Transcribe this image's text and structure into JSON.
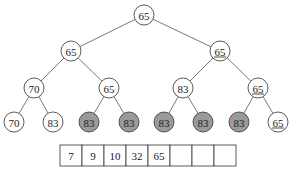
{
  "colors": {
    "shaded_fill": "#9a9a9a",
    "plain_fill": "#ffffff",
    "stroke": "#333333"
  },
  "tree": {
    "nodes": [
      {
        "id": "n0",
        "label": "65",
        "x": 144,
        "y": 15,
        "shaded": false,
        "underlined": false
      },
      {
        "id": "n1",
        "label": "65",
        "x": 71,
        "y": 51,
        "shaded": false,
        "underlined": false
      },
      {
        "id": "n2",
        "label": "65",
        "x": 220,
        "y": 51,
        "shaded": false,
        "underlined": true
      },
      {
        "id": "n3",
        "label": "70",
        "x": 34,
        "y": 88,
        "shaded": false,
        "underlined": false
      },
      {
        "id": "n4",
        "label": "65",
        "x": 109,
        "y": 88,
        "shaded": false,
        "underlined": false
      },
      {
        "id": "n5",
        "label": "83",
        "x": 183,
        "y": 88,
        "shaded": false,
        "underlined": false
      },
      {
        "id": "n6",
        "label": "65",
        "x": 258,
        "y": 88,
        "shaded": false,
        "underlined": true
      },
      {
        "id": "n7",
        "label": "70",
        "x": 14,
        "y": 122,
        "shaded": false,
        "underlined": false
      },
      {
        "id": "n8",
        "label": "83",
        "x": 53,
        "y": 122,
        "shaded": false,
        "underlined": false
      },
      {
        "id": "n9",
        "label": "83",
        "x": 89,
        "y": 122,
        "shaded": true,
        "underlined": false
      },
      {
        "id": "n10",
        "label": "83",
        "x": 129,
        "y": 122,
        "shaded": true,
        "underlined": false
      },
      {
        "id": "n11",
        "label": "83",
        "x": 164,
        "y": 122,
        "shaded": true,
        "underlined": false
      },
      {
        "id": "n12",
        "label": "83",
        "x": 203,
        "y": 122,
        "shaded": true,
        "underlined": false
      },
      {
        "id": "n13",
        "label": "83",
        "x": 239,
        "y": 122,
        "shaded": true,
        "underlined": false
      },
      {
        "id": "n14",
        "label": "65",
        "x": 278,
        "y": 122,
        "shaded": false,
        "underlined": true
      }
    ],
    "edges": [
      [
        "n0",
        "n1"
      ],
      [
        "n0",
        "n2"
      ],
      [
        "n1",
        "n3"
      ],
      [
        "n1",
        "n4"
      ],
      [
        "n2",
        "n5"
      ],
      [
        "n2",
        "n6"
      ],
      [
        "n3",
        "n7"
      ],
      [
        "n3",
        "n8"
      ],
      [
        "n4",
        "n9"
      ],
      [
        "n4",
        "n10"
      ],
      [
        "n5",
        "n11"
      ],
      [
        "n5",
        "n12"
      ],
      [
        "n6",
        "n13"
      ],
      [
        "n6",
        "n14"
      ]
    ]
  },
  "array": {
    "x": 60,
    "y": 145,
    "cell_width": 22,
    "cell_height": 21,
    "cells": [
      "7",
      "9",
      "10",
      "32",
      "65",
      "",
      "",
      ""
    ]
  }
}
